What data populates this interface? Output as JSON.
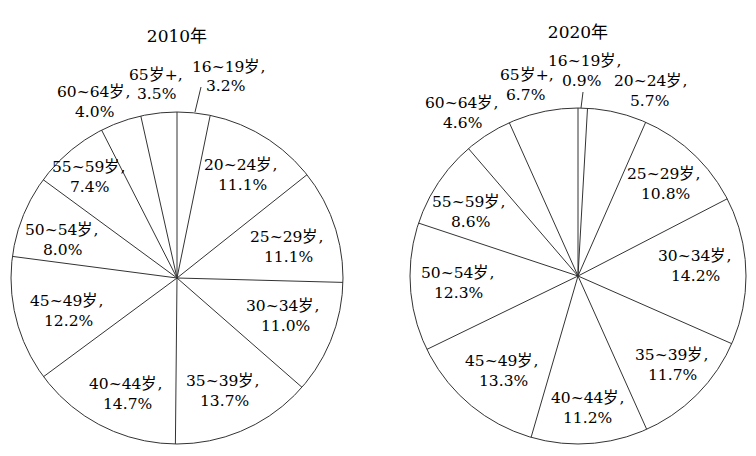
{
  "chart_data": [
    {
      "type": "pie",
      "title": "2010年",
      "unit": "%",
      "categories": [
        "16~19岁",
        "20~24岁",
        "25~29岁",
        "30~34岁",
        "35~39岁",
        "40~44岁",
        "45~49岁",
        "50~54岁",
        "55~59岁",
        "60~64岁",
        "65岁+"
      ],
      "values": [
        3.2,
        11.1,
        11.1,
        11.0,
        13.7,
        14.7,
        12.2,
        8.0,
        7.4,
        4.0,
        3.5
      ],
      "labels": [
        "16~19岁，3.2%",
        "20~24岁，11.1%",
        "25~29岁，11.1%",
        "30~34岁，11.0%",
        "35~39岁，13.7%",
        "40~44岁，14.7%",
        "45~49岁，12.2%",
        "50~54岁，8.0%",
        "55~59岁，7.4%",
        "60~64岁，4.0%",
        "65岁+，3.5%"
      ],
      "start": "12 o'clock, clockwise",
      "legend": "none (inline labels)"
    },
    {
      "type": "pie",
      "title": "2020年",
      "unit": "%",
      "categories": [
        "16~19岁",
        "20~24岁",
        "25~29岁",
        "30~34岁",
        "35~39岁",
        "40~44岁",
        "45~49岁",
        "50~54岁",
        "55~59岁",
        "60~64岁",
        "65岁+"
      ],
      "values": [
        0.9,
        5.7,
        10.8,
        14.2,
        11.7,
        11.2,
        13.3,
        12.3,
        8.6,
        4.6,
        6.7
      ],
      "labels": [
        "16~19岁，0.9%",
        "20~24岁，5.7%",
        "25~29岁，10.8%",
        "30~34岁，14.2%",
        "35~39岁，11.7%",
        "40~44岁，11.2%",
        "45~49岁，13.3%",
        "50~54岁，12.3%",
        "55~59岁，8.6%",
        "60~64岁，4.6%",
        "65岁+，6.7%"
      ],
      "start": "12 o'clock, clockwise",
      "legend": "none (inline labels)"
    }
  ],
  "pies": [
    {
      "title": "2010年",
      "slices": [
        {
          "name": "16~19岁,",
          "pct": "3.2%"
        },
        {
          "name": "20~24岁,",
          "pct": "11.1%"
        },
        {
          "name": "25~29岁,",
          "pct": "11.1%"
        },
        {
          "name": "30~34岁,",
          "pct": "11.0%"
        },
        {
          "name": "35~39岁,",
          "pct": "13.7%"
        },
        {
          "name": "40~44岁,",
          "pct": "14.7%"
        },
        {
          "name": "45~49岁,",
          "pct": "12.2%"
        },
        {
          "name": "50~54岁,",
          "pct": "8.0%"
        },
        {
          "name": "55~59岁,",
          "pct": "7.4%"
        },
        {
          "name": "60~64岁,",
          "pct": "4.0%"
        },
        {
          "name": "65岁+,",
          "pct": "3.5%"
        }
      ]
    },
    {
      "title": "2020年",
      "slices": [
        {
          "name": "16~19岁,",
          "pct": "0.9%"
        },
        {
          "name": "20~24岁,",
          "pct": "5.7%"
        },
        {
          "name": "25~29岁,",
          "pct": "10.8%"
        },
        {
          "name": "30~34岁,",
          "pct": "14.2%"
        },
        {
          "name": "35~39岁,",
          "pct": "11.7%"
        },
        {
          "name": "40~44岁,",
          "pct": "11.2%"
        },
        {
          "name": "45~49岁,",
          "pct": "13.3%"
        },
        {
          "name": "50~54岁,",
          "pct": "12.3%"
        },
        {
          "name": "55~59岁,",
          "pct": "8.6%"
        },
        {
          "name": "60~64岁,",
          "pct": "4.6%"
        },
        {
          "name": "65岁+,",
          "pct": "6.7%"
        }
      ]
    }
  ]
}
